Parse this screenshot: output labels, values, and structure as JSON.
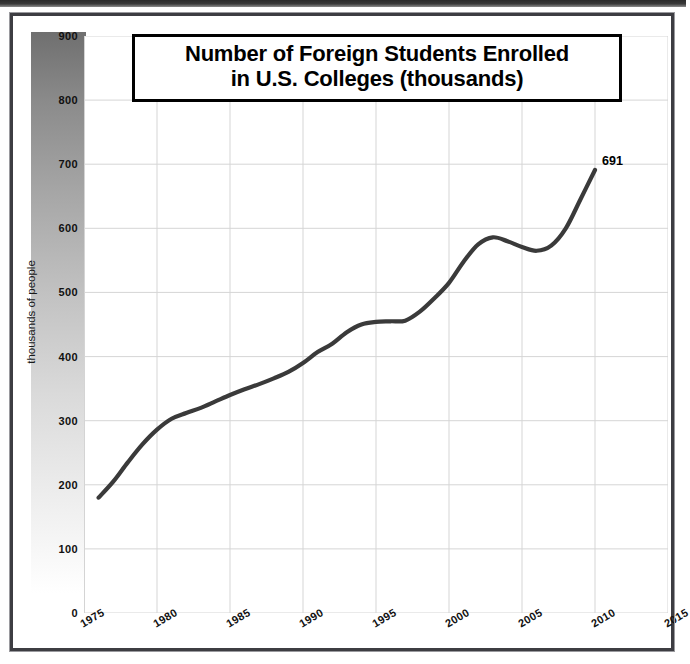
{
  "chart_data": {
    "type": "line",
    "title": "Number of Foreign Students Enrolled in U.S. Colleges (thousands)",
    "title_lines": [
      "Number of Foreign Students Enrolled",
      "in U.S. Colleges (thousands)"
    ],
    "xlabel": "",
    "ylabel": "thousands of people",
    "xlim": [
      1975,
      2015
    ],
    "ylim": [
      0,
      900
    ],
    "y_ticks": [
      0,
      100,
      200,
      300,
      400,
      500,
      600,
      700,
      800,
      900
    ],
    "y_tick_labels": [
      "0",
      "100",
      "200",
      "300",
      "400",
      "500",
      "600",
      "700",
      "800",
      "900"
    ],
    "x_ticks": [
      1975,
      1980,
      1985,
      1990,
      1995,
      2000,
      2005,
      2010,
      2015
    ],
    "x_tick_labels": [
      "1975",
      "1980",
      "1985",
      "1990",
      "1995",
      "2000",
      "2005",
      "2010",
      "2015"
    ],
    "grid": true,
    "legend": false,
    "line_color": "#3a3a3a",
    "series": [
      {
        "name": "Foreign students enrolled",
        "x": [
          1976,
          1977,
          1978,
          1979,
          1980,
          1981,
          1982,
          1983,
          1984,
          1985,
          1986,
          1987,
          1988,
          1989,
          1990,
          1991,
          1992,
          1993,
          1994,
          1995,
          1996,
          1997,
          1998,
          1999,
          2000,
          2001,
          2002,
          2003,
          2004,
          2005,
          2006,
          2007,
          2008,
          2009,
          2010
        ],
        "values": [
          180,
          205,
          235,
          263,
          286,
          303,
          312,
          320,
          330,
          340,
          349,
          357,
          366,
          376,
          390,
          407,
          420,
          438,
          450,
          454,
          455,
          456,
          470,
          491,
          515,
          548,
          575,
          586,
          580,
          571,
          565,
          573,
          600,
          645,
          691
        ]
      }
    ],
    "annotations": [
      {
        "label": "691",
        "x": 2010,
        "y": 691
      }
    ]
  }
}
